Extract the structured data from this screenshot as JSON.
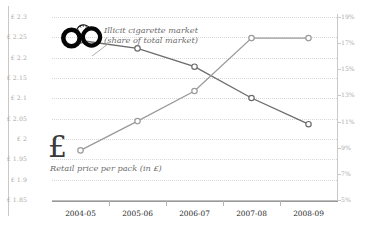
{
  "chart_data": {
    "type": "line",
    "title": "",
    "categories": [
      "2004-05",
      "2005-06",
      "2006-07",
      "2007-08",
      "2008-09"
    ],
    "grid": true,
    "legend_position": "inline-annotations",
    "series": [
      {
        "name": "Illicit cigarette market (share of total market)",
        "axis": "right",
        "unit": "%",
        "values": [
          17.2,
          16.6,
          15.2,
          12.8,
          10.8
        ],
        "icon": "handcuffs-icon",
        "color": "#6b6b6b"
      },
      {
        "name": "Retail price per pack (in £)",
        "axis": "left",
        "unit": "£",
        "values": [
          1.972,
          2.044,
          2.118,
          2.248,
          2.248
        ],
        "icon": "pound-sign-icon",
        "color": "#9a9a9a"
      }
    ],
    "left_axis": {
      "label": "Retail price per pack (in £)",
      "ylim": [
        1.85,
        2.3
      ],
      "step": 0.05,
      "ticks": [
        "£ 2.3",
        "£ 2.25",
        "£ 2.2",
        "£ 2.15",
        "£ 2.1",
        "£ 2.05",
        "£ 2",
        "£ 1.95",
        "£ 1.9",
        "£ 1.85"
      ],
      "tick_values": [
        2.3,
        2.25,
        2.2,
        2.15,
        2.1,
        2.05,
        2.0,
        1.95,
        1.9,
        1.85
      ]
    },
    "right_axis": {
      "label": "Share of total market (%)",
      "ylim": [
        5,
        19
      ],
      "step": 2,
      "ticks": [
        "19%",
        "17%",
        "15%",
        "13%",
        "11%",
        "9%",
        "7%",
        "5%"
      ],
      "tick_values": [
        19,
        17,
        15,
        13,
        11,
        9,
        7,
        5
      ]
    },
    "xlabel": "",
    "annotations": [
      "Illicit cigarette market",
      "(share of total market)",
      "Retail price per pack (in £)"
    ]
  },
  "annotations": {
    "illicit_line1": "Illicit cigarette market",
    "illicit_line2": "(share of total market)",
    "price": "Retail price per pack (in £)",
    "pound_glyph": "£"
  }
}
